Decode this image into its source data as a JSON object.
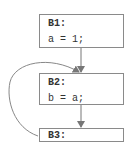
{
  "diagram": {
    "type": "control-flow-graph",
    "blocks": [
      {
        "id": "B1",
        "title": "B1:",
        "code": "a = 1;"
      },
      {
        "id": "B2",
        "title": "B2:",
        "code": "b = a;"
      },
      {
        "id": "B3",
        "title": "B3:",
        "code": ""
      }
    ],
    "edges": [
      {
        "from": "B1",
        "to": "B2",
        "kind": "straight"
      },
      {
        "from": "B2",
        "to": "B3",
        "kind": "straight"
      },
      {
        "from": "B3",
        "to": "B2",
        "kind": "back-edge-curved"
      }
    ],
    "colors": {
      "stroke": "#8a8a8a",
      "text": "#333333"
    }
  }
}
